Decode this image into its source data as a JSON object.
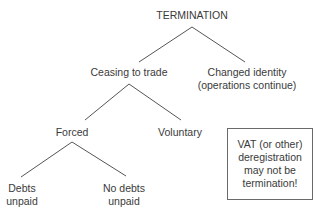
{
  "diagram": {
    "type": "tree",
    "root": {
      "label": "TERMINATION",
      "children": [
        {
          "label": "Ceasing to trade",
          "children": [
            {
              "label": "Forced",
              "children": [
                {
                  "label_lines": [
                    "Debts",
                    "unpaid"
                  ]
                },
                {
                  "label_lines": [
                    "No debts",
                    "unpaid"
                  ]
                }
              ]
            },
            {
              "label": "Voluntary"
            }
          ]
        },
        {
          "label_lines": [
            "Changed identity",
            "(operations continue)"
          ]
        }
      ]
    },
    "note_box": {
      "lines": [
        "VAT (or other)",
        "deregistration",
        "may not be",
        "termination!"
      ]
    },
    "colors": {
      "text": "#3a3a3a",
      "lines": "#555555",
      "box_border": "#6a6a6a",
      "background": "#ffffff"
    }
  }
}
